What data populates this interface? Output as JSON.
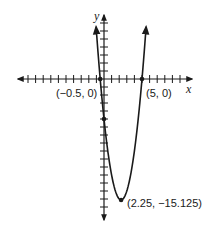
{
  "chart_data": {
    "type": "line",
    "title": "",
    "function_description": "Parabola opening upward",
    "xlabel": "x",
    "ylabel": "y",
    "xlim": [
      -11.5,
      11.5
    ],
    "ylim": [
      -17.5,
      8.5
    ],
    "grid": false,
    "tick_spacing": 1,
    "series": [
      {
        "name": "parabola",
        "equation_implied": "y = 2x^2 - 9x - 5",
        "x": [
          -1.04,
          -0.5,
          0,
          0.5,
          1,
          1.5,
          2,
          2.25,
          2.5,
          3,
          3.5,
          4,
          4.5,
          5,
          5.54
        ],
        "y": [
          6.5,
          0,
          -5,
          -9,
          -12,
          -14,
          -15,
          -15.125,
          -15,
          -14,
          -12,
          -9,
          -5,
          0,
          6.5
        ]
      }
    ],
    "points": [
      {
        "x": -0.5,
        "y": 0,
        "label": "(−0.5, 0)"
      },
      {
        "x": 5,
        "y": 0,
        "label": "(5, 0)"
      },
      {
        "x": 0,
        "y": -5,
        "label": ""
      },
      {
        "x": 2.25,
        "y": -15.125,
        "label": "(2.25, −15.125)"
      }
    ],
    "annotations": [
      "(−0.5, 0)",
      "(5, 0)",
      "(2.25, −15.125)"
    ]
  },
  "labels": {
    "x_axis": "x",
    "y_axis": "y",
    "root_left": "(−0.5, 0)",
    "root_right": "(5, 0)",
    "vertex": "(2.25, −15.125)"
  },
  "colors": {
    "ink": "#1a1a1a",
    "background": "#ffffff"
  }
}
